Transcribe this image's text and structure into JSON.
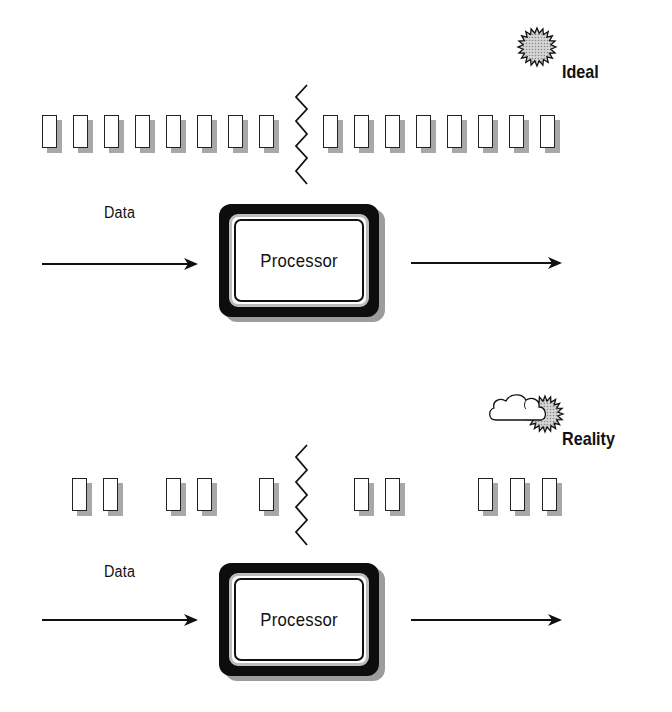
{
  "panels": {
    "ideal": {
      "heading": "Ideal",
      "weather_icon": "sun-icon",
      "data_label": "Data",
      "processor_label": "Processor",
      "left_packets_x": [
        42,
        73,
        104,
        135,
        166,
        197,
        228,
        259
      ],
      "right_packets_x": [
        323,
        354,
        385,
        416,
        447,
        478,
        509,
        540
      ],
      "packet_top": 115
    },
    "reality": {
      "heading": "Reality",
      "weather_icon": "cloud-sun-icon",
      "data_label": "Data",
      "processor_label": "Processor",
      "left_packets_x": [
        72,
        103,
        166,
        197,
        259
      ],
      "right_packets_x": [
        354,
        385,
        478,
        510,
        542
      ],
      "packet_top": 478
    }
  },
  "colors": {
    "stroke": "#111111",
    "shadow": "#a8a8a8",
    "sun_fill": "#c8c8c8",
    "processor_frame": "#0d0d0d",
    "processor_ring": "#bdbdbd"
  }
}
